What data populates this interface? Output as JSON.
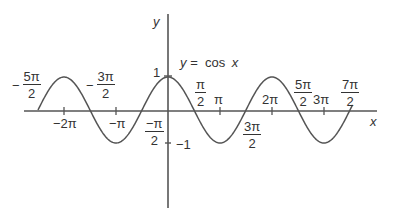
{
  "chart_data": {
    "type": "line",
    "title": "y = cos x",
    "function": "cos",
    "xlabel": "x",
    "ylabel": "y",
    "xlim": [
      -2.6,
      3.6
    ],
    "xlim_units": "pi",
    "ylim": [
      -1,
      1
    ],
    "grid": false,
    "legend": null,
    "curve_label": "y = cos x",
    "curve_domain_pi": [
      -2.5,
      3.55
    ],
    "x_ticks": [
      {
        "value_pi": -2.5,
        "label": "−5π/2",
        "num": "5π",
        "den": "2",
        "sign": "−",
        "position": "above"
      },
      {
        "value_pi": -2,
        "label": "−2π",
        "position": "below"
      },
      {
        "value_pi": -1.5,
        "label": "−3π/2",
        "num": "3π",
        "den": "2",
        "sign": "−",
        "position": "above"
      },
      {
        "value_pi": -1,
        "label": "−π",
        "position": "below"
      },
      {
        "value_pi": -0.5,
        "label": "−π/2",
        "num": "−π",
        "den": "2",
        "sign": "",
        "position": "below"
      },
      {
        "value_pi": 0.5,
        "label": "π/2",
        "num": "π",
        "den": "2",
        "sign": "",
        "position": "above"
      },
      {
        "value_pi": 1,
        "label": "π",
        "position": "above"
      },
      {
        "value_pi": 1.5,
        "label": "3π/2",
        "num": "3π",
        "den": "2",
        "sign": "",
        "position": "below"
      },
      {
        "value_pi": 2,
        "label": "2π",
        "position": "above"
      },
      {
        "value_pi": 2.5,
        "label": "5π/2",
        "num": "5π",
        "den": "2",
        "sign": "",
        "position": "above"
      },
      {
        "value_pi": 3,
        "label": "3π",
        "position": "above"
      },
      {
        "value_pi": 3.5,
        "label": "7π/2",
        "num": "7π",
        "den": "2",
        "sign": "",
        "position": "above"
      }
    ],
    "y_ticks": [
      {
        "value": 1,
        "label": "1"
      },
      {
        "value": -1,
        "label": "−1"
      }
    ],
    "points": [
      {
        "x_pi": -2.5,
        "y": 0
      },
      {
        "x_pi": -2,
        "y": 1
      },
      {
        "x_pi": -1.5,
        "y": 0
      },
      {
        "x_pi": -1,
        "y": -1
      },
      {
        "x_pi": -0.5,
        "y": 0
      },
      {
        "x_pi": 0,
        "y": 1
      },
      {
        "x_pi": 0.5,
        "y": 0
      },
      {
        "x_pi": 1,
        "y": -1
      },
      {
        "x_pi": 1.5,
        "y": 0
      },
      {
        "x_pi": 2,
        "y": 1
      },
      {
        "x_pi": 2.5,
        "y": 0
      },
      {
        "x_pi": 3,
        "y": -1
      },
      {
        "x_pi": 3.5,
        "y": 0
      }
    ]
  },
  "labels": {
    "x_axis": "x",
    "y_axis": "y",
    "equation_y": "y",
    "equation_rest": "=  cos",
    "equation_x": "x",
    "y_one": "1",
    "y_neg_one": "−1",
    "neg_two_pi": "−2π",
    "neg_pi": "−π",
    "pi": "π",
    "two_pi": "2π",
    "three_pi": "3π",
    "neg5pi2": {
      "sign": "−",
      "num": "5π",
      "den": "2"
    },
    "neg3pi2": {
      "sign": "−",
      "num": "3π",
      "den": "2"
    },
    "negpi2": {
      "num": "−π",
      "den": "2"
    },
    "pi2": {
      "num": "π",
      "den": "2"
    },
    "threepi2": {
      "num": "3π",
      "den": "2"
    },
    "fivepi2": {
      "num": "5π",
      "den": "2"
    },
    "sevenpi2": {
      "num": "7π",
      "den": "2"
    }
  },
  "colors": {
    "axis": "#555555",
    "curve": "#555555",
    "text": "#333333"
  }
}
